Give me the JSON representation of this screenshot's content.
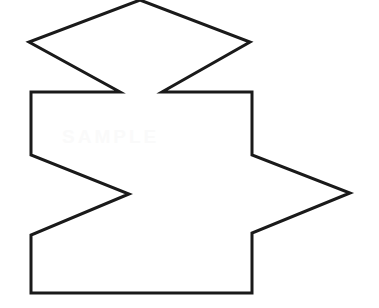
{
  "canvas": {
    "width": 379,
    "height": 308,
    "background_color": "#ffffff"
  },
  "figure": {
    "name": "irregular-zigzag-polygon",
    "stroke_color": "#1a1a1a",
    "stroke_width": 3,
    "fill_color": "none",
    "vertex_count": 15,
    "vertices": [
      [
        140,
        0
      ],
      [
        250,
        42
      ],
      [
        162,
        92
      ],
      [
        252,
        92
      ],
      [
        252,
        155
      ],
      [
        350,
        193
      ],
      [
        252,
        233
      ],
      [
        252,
        293
      ],
      [
        31,
        293
      ],
      [
        31,
        235
      ],
      [
        129,
        194
      ],
      [
        31,
        155
      ],
      [
        31,
        92
      ],
      [
        120,
        92
      ],
      [
        29,
        42
      ]
    ],
    "points_string": "140,0 250,42 162,92 252,92 252,155 350,193 252,233 252,293 31,293 31,235 129,194 31,155 31,92 120,92 29,42"
  },
  "watermark": {
    "text": "SAMPLE",
    "color": "#fafafa",
    "visible": true
  }
}
